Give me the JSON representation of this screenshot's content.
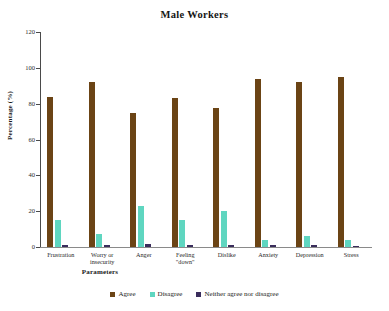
{
  "chart_data": {
    "type": "bar",
    "title": "Male Workers",
    "xlabel": "Parameters",
    "ylabel": "Percentage (%)",
    "ylim": [
      0,
      120
    ],
    "yticks": [
      0,
      20,
      40,
      60,
      80,
      100,
      120
    ],
    "grid": false,
    "legend_position": "bottom",
    "categories": [
      "Frustration",
      "Worry or\ninsecurity",
      "Anger",
      "Feeling\n\"down\"",
      "Dislike",
      "Anxiety",
      "Depression",
      "Stress"
    ],
    "series": [
      {
        "name": "Agree",
        "color": "#6B4415",
        "values": [
          84,
          92,
          75,
          83,
          77.5,
          94,
          92,
          95
        ]
      },
      {
        "name": "Disagree",
        "color": "#5FD6C0",
        "values": [
          15,
          7,
          23,
          15,
          20,
          4,
          6,
          4
        ]
      },
      {
        "name": "Neither agree nor disagree",
        "color": "#3A2D5C",
        "values": [
          1,
          1,
          1.5,
          1,
          1,
          1,
          1,
          0.8
        ]
      }
    ]
  }
}
